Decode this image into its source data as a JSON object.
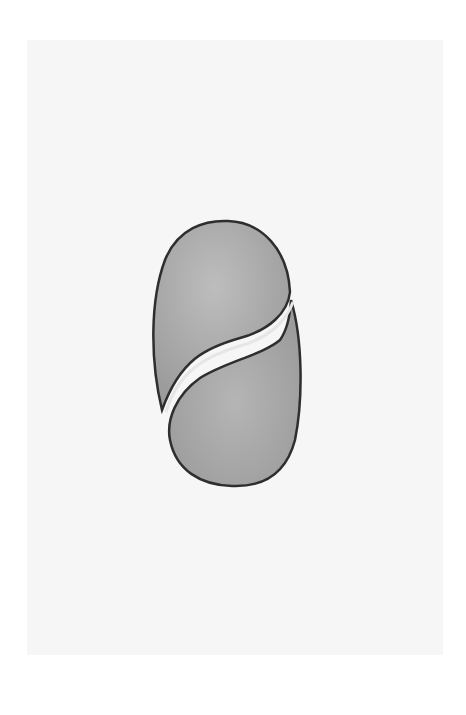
{
  "image": {
    "subject": "pencil drawing of an oval seed/spore divided by an S-shaped curve into two halves",
    "colors": {
      "page_background": "#ffffff",
      "paper": "#f6f6f6",
      "fill": "#a9a9a9",
      "fill_highlight": "#bdbdbd",
      "outline": "#2e2e2e",
      "groove_highlight": "#e6e6e6"
    },
    "caption": ""
  }
}
